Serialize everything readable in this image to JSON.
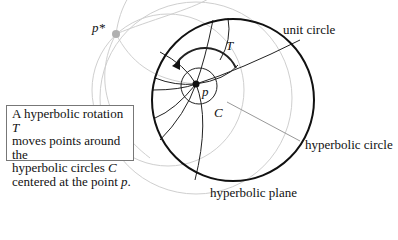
{
  "labels": {
    "p_star": "p*",
    "p": "p",
    "T": "T",
    "C": "C",
    "unit_circle": "unit circle",
    "hyperbolic_circle": "hyperbolic circle",
    "hyperbolic_plane": "hyperbolic plane"
  },
  "caption": {
    "line1_pre": "A hyperbolic rotation ",
    "line1_var": "T",
    "line2": "moves points around the",
    "line3_pre": "hyperbolic circles ",
    "line3_var": "C",
    "line4_pre": "centered at the point ",
    "line4_var": "p",
    "line4_post": "."
  },
  "colors": {
    "main_stroke": "#111111",
    "ghost_stroke": "#c8c8c8",
    "pointer_stroke": "#999999",
    "p_star_fill": "#b0b0b0"
  }
}
